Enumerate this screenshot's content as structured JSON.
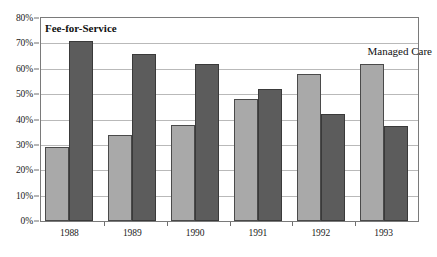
{
  "chart_data": {
    "type": "bar",
    "title": "",
    "subtitle": "",
    "xlabel": "",
    "ylabel": "",
    "categories": [
      "1988",
      "1989",
      "1990",
      "1991",
      "1992",
      "1993"
    ],
    "series": [
      {
        "name": "Fee-for-Service",
        "color": "#a9a9a9",
        "values": [
          29,
          34,
          38,
          48,
          58,
          62
        ]
      },
      {
        "name": "Managed Care",
        "color": "#5c5c5c",
        "values": [
          71,
          66,
          62,
          52,
          42,
          37.5
        ]
      }
    ],
    "ylim": [
      0,
      80
    ],
    "ytick_values": [
      0,
      10,
      20,
      30,
      40,
      50,
      60,
      70,
      80
    ],
    "ytick_labels": [
      "0%",
      "10%",
      "20%",
      "30%",
      "40%",
      "50%",
      "60%",
      "70%",
      "80%"
    ],
    "grid": true,
    "legend_position": "inline-annotations",
    "annotations": [
      {
        "text": "Fee-for-Service",
        "series": "Fee-for-Service",
        "bold": true
      },
      {
        "text": "Managed Care",
        "series": "Managed Care",
        "bold": false
      }
    ],
    "units": "percent"
  }
}
